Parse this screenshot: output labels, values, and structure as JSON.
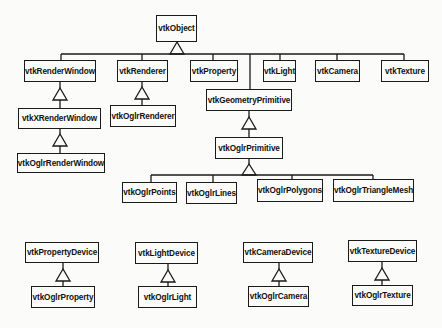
{
  "diagram": {
    "type": "class-hierarchy",
    "colors": {
      "line": "#1a1a1a",
      "background": "#fbfbf9",
      "text": "#111111"
    },
    "classes": {
      "vtkObject": "vtkObject",
      "vtkRenderWindow": "vtkRenderWindow",
      "vtkXRenderWindow": "vtkXRenderWindow",
      "vtkOglrRenderWindow": "vtkOglrRenderWindow",
      "vtkRenderer": "vtkRenderer",
      "vtkOglrRenderer": "vtkOglrRenderer",
      "vtkProperty": "vtkProperty",
      "vtkLight": "vtkLight",
      "vtkCamera": "vtkCamera",
      "vtkTexture": "vtkTexture",
      "vtkGeometryPrimitive": "vtkGeometryPrimitive",
      "vtkOglrPrimitive": "vtkOglrPrimitive",
      "vtkOglrPoints": "vtkOglrPoints",
      "vtkOglrLines": "vtkOglrLines",
      "vtkOglrPolygons": "vtkOglrPolygons",
      "vtkOglrTriangleMesh": "vtkOglrTriangleMesh",
      "vtkPropertyDevice": "vtkPropertyDevice",
      "vtkOglrProperty": "vtkOglrProperty",
      "vtkLightDevice": "vtkLightDevice",
      "vtkOglrLight": "vtkOglrLight",
      "vtkCameraDevice": "vtkCameraDevice",
      "vtkOglrCamera": "vtkOglrCamera",
      "vtkTextureDevice": "vtkTextureDevice",
      "vtkOglrTexture": "vtkOglrTexture"
    },
    "inheritance": [
      {
        "parent": "vtkObject",
        "children": [
          "vtkRenderWindow",
          "vtkRenderer",
          "vtkProperty",
          "vtkGeometryPrimitive",
          "vtkLight",
          "vtkCamera",
          "vtkTexture"
        ]
      },
      {
        "parent": "vtkRenderWindow",
        "children": [
          "vtkXRenderWindow"
        ]
      },
      {
        "parent": "vtkXRenderWindow",
        "children": [
          "vtkOglrRenderWindow"
        ]
      },
      {
        "parent": "vtkRenderer",
        "children": [
          "vtkOglrRenderer"
        ]
      },
      {
        "parent": "vtkGeometryPrimitive",
        "children": [
          "vtkOglrPrimitive"
        ]
      },
      {
        "parent": "vtkOglrPrimitive",
        "children": [
          "vtkOglrPoints",
          "vtkOglrLines",
          "vtkOglrPolygons",
          "vtkOglrTriangleMesh"
        ]
      },
      {
        "parent": "vtkPropertyDevice",
        "children": [
          "vtkOglrProperty"
        ]
      },
      {
        "parent": "vtkLightDevice",
        "children": [
          "vtkOglrLight"
        ]
      },
      {
        "parent": "vtkCameraDevice",
        "children": [
          "vtkOglrCamera"
        ]
      },
      {
        "parent": "vtkTextureDevice",
        "children": [
          "vtkOglrTexture"
        ]
      }
    ]
  }
}
